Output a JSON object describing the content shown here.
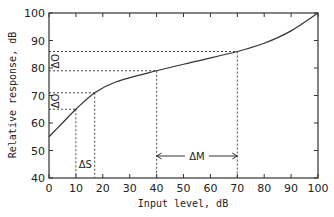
{
  "chart_data": {
    "type": "line",
    "title": "",
    "xlabel": "Input level, dB",
    "ylabel": "Relative response, dB",
    "xlim": [
      0,
      100
    ],
    "ylim": [
      40,
      100
    ],
    "xticks": [
      "0",
      "10",
      "20",
      "30",
      "40",
      "50",
      "60",
      "70",
      "80",
      "90",
      "100"
    ],
    "yticks": [
      "40",
      "50",
      "60",
      "70",
      "80",
      "90",
      "100"
    ],
    "grid": false,
    "series": [
      {
        "name": "Response curve",
        "x": [
          0,
          5,
          10,
          17,
          25,
          40,
          55,
          70,
          80,
          90,
          100
        ],
        "y": [
          55,
          60,
          65,
          71,
          75,
          79,
          82.5,
          86,
          89,
          93.5,
          100
        ]
      }
    ],
    "annotations": [
      {
        "label": "ΔO",
        "type": "vertical-span",
        "x": 0,
        "y_from": 65,
        "y_to": 71
      },
      {
        "label": "ΔO",
        "type": "vertical-span",
        "x": 0,
        "y_from": 79,
        "y_to": 86
      },
      {
        "label": "ΔS",
        "type": "horizontal-span",
        "x_from": 10,
        "x_to": 17
      },
      {
        "label": "ΔM",
        "type": "horizontal-arrow",
        "x_from": 40,
        "x_to": 70,
        "y": 48
      }
    ],
    "reference_lines": {
      "vertical_x": [
        10,
        17,
        40,
        70
      ],
      "horizontal_y": [
        65,
        71,
        79,
        86
      ]
    }
  }
}
